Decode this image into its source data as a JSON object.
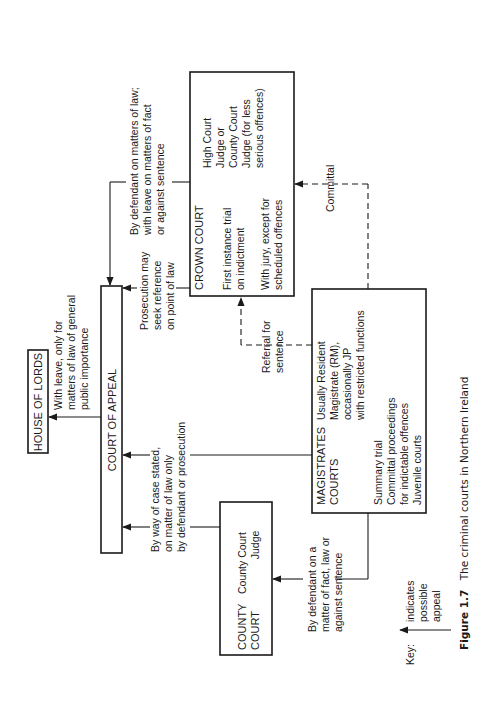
{
  "nodes": {
    "house_of_lords": {
      "title": "HOUSE OF LORDS"
    },
    "court_of_appeal": {
      "title": "COURT OF APPEAL"
    },
    "crown_court": {
      "title": "CROWN COURT",
      "lines": [
        "First instance trial",
        "on indictment",
        "With jury, except for",
        "scheduled offences"
      ],
      "judge": [
        "High Court",
        "Judge or",
        "County Court",
        "Judge (for less",
        "serious offences)"
      ]
    },
    "magistrates_courts": {
      "title": [
        "MAGISTRATES",
        "COURTS"
      ],
      "judge": [
        "Usually Resident",
        "Magistrate (RM),",
        "occasionally JP",
        "with restricted functions"
      ],
      "functions": [
        "Summary trial",
        "Committal proceedings",
        "for indictable offences",
        "Juvenile courts"
      ]
    },
    "county_court": {
      "title": [
        "COUNTY",
        "COURT"
      ],
      "judge": [
        "County Court",
        "Judge"
      ]
    }
  },
  "edges": {
    "coa_to_hol": [
      "With leave, only for",
      "matters of law of general",
      "public importance"
    ],
    "crown_to_coa_defendant": [
      "By defendant on matters of law;",
      "with leave on matters of fact",
      "or against sentence"
    ],
    "crown_to_coa_prosecution": [
      "Prosecution may",
      "seek reference",
      "on point of law"
    ],
    "mag_to_crown_referral": [
      "Referral for",
      "sentence"
    ],
    "mag_to_crown_committal": [
      "Committal"
    ],
    "case_stated": [
      "By way of case stated,",
      "on matter of law only",
      "by defendant or prosecution"
    ],
    "mag_to_county": [
      "By defendant on a",
      "matter of fact, law or",
      "against sentence"
    ]
  },
  "key": {
    "label": "Key:",
    "meaning": [
      "indicates",
      "possible",
      "appeal"
    ]
  },
  "caption": {
    "label": "Figure 1.7",
    "text": "The criminal courts in Northern Ireland"
  }
}
